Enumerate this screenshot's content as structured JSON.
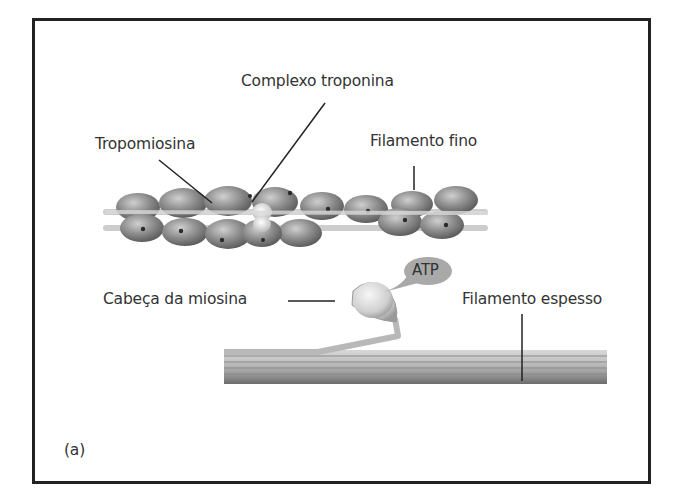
{
  "diagram": {
    "panel_label": "(a)",
    "labels": {
      "troponin_complex": "Complexo troponina",
      "tropomyosin": "Tropomiosina",
      "thin_filament": "Filamento fino",
      "myosin_head": "Cabeça da miosina",
      "atp": "ATP",
      "thick_filament": "Filamento espesso"
    },
    "colors": {
      "border": "#222222",
      "actin_bead": "#8a8a8a",
      "strand": "#c8c8c8",
      "myosin_head": "#d9d9d9",
      "atp_bubble": "#a9a9a9",
      "text": "#333333"
    }
  }
}
